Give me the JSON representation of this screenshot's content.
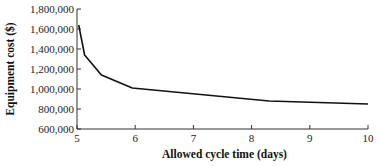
{
  "chart_data": {
    "type": "line",
    "title": "",
    "xlabel": "Allowed cycle time (days)",
    "ylabel": "Equipment cost ($)",
    "xlim": [
      5,
      10
    ],
    "ylim": [
      600000,
      1800000
    ],
    "x_ticks": [
      "5",
      "6",
      "7",
      "8",
      "9",
      "10"
    ],
    "y_ticks": [
      "600,000",
      "800,000",
      "1,000,000",
      "1,200,000",
      "1,400,000",
      "1,600,000",
      "1,800,000"
    ],
    "grid": false,
    "legend": null,
    "series": [
      {
        "name": "Equipment cost",
        "x": [
          5.03,
          5.13,
          5.42,
          5.95,
          8.3,
          10.0
        ],
        "y": [
          1640000,
          1340000,
          1140000,
          1010000,
          880000,
          850000
        ],
        "color": "#111111"
      }
    ]
  }
}
